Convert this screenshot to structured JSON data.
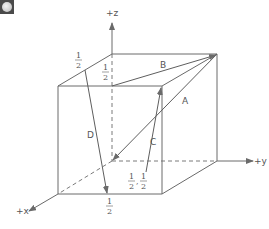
{
  "diagram": {
    "type": "unit-cube-vectors",
    "colors": {
      "line": "#6a6a6a",
      "text": "#555555",
      "background": "#ffffff"
    },
    "axes": {
      "z": {
        "label": "+z"
      },
      "y": {
        "label": "+y"
      },
      "x": {
        "label": "+x"
      }
    },
    "vectors": [
      {
        "name": "A",
        "label": "A"
      },
      {
        "name": "B",
        "label": "B"
      },
      {
        "name": "C",
        "label": "C"
      },
      {
        "name": "D",
        "label": "D"
      }
    ],
    "fractions": {
      "d_top": {
        "num": "1",
        "den": "2"
      },
      "b_start": {
        "num": "1",
        "den": "2"
      },
      "d_end": {
        "num": "1",
        "den": "2"
      },
      "c_start_a": {
        "num": "1",
        "den": "2"
      },
      "c_start_b": {
        "num": "1",
        "den": "2"
      },
      "c_start_sep": ","
    }
  }
}
